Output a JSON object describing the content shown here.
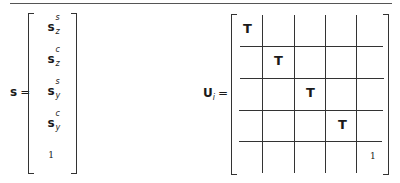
{
  "vector_s": {
    "label": "s",
    "equals": "=",
    "entries": [
      {
        "base": "s",
        "sup": "s",
        "sub": "z"
      },
      {
        "base": "s",
        "sup": "c",
        "sub": "z"
      },
      {
        "base": "s",
        "sup": "s",
        "sub": "y"
      },
      {
        "base": "s",
        "sup": "c",
        "sub": "y"
      },
      {
        "base": "1"
      }
    ]
  },
  "matrix_U": {
    "label": "U",
    "subscript": "i",
    "equals": "=",
    "size": "5x5 block",
    "diagonal": [
      "T",
      "T",
      "T",
      "T",
      "1"
    ]
  }
}
